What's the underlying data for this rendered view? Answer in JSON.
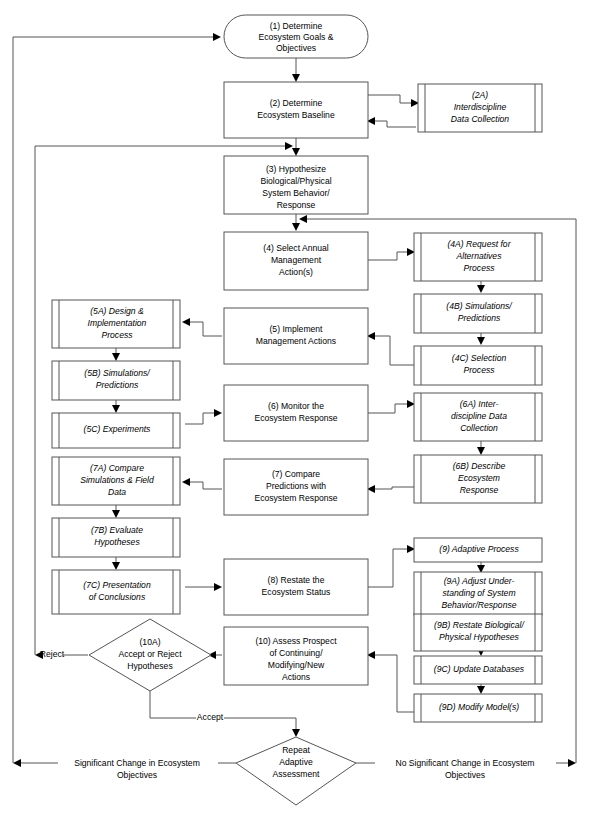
{
  "diagram": {
    "colors": {
      "background": "#ffffff",
      "stroke": "#555555",
      "arrow": "#000000",
      "text": "#000000"
    },
    "nodes": [
      {
        "id": "n1",
        "shape": "terminator",
        "italic": false,
        "lines": [
          "(1) Determine",
          "Ecosystem Goals &",
          "Objectives"
        ]
      },
      {
        "id": "n2",
        "shape": "process",
        "italic": false,
        "lines": [
          "(2) Determine",
          "Ecosystem Baseline"
        ]
      },
      {
        "id": "n2a",
        "shape": "predefined-process",
        "italic": true,
        "lines": [
          "(2A)",
          "Interdiscipline",
          "Data Collection"
        ]
      },
      {
        "id": "n3",
        "shape": "process",
        "italic": false,
        "lines": [
          "(3) Hypothesize",
          "Biological/Physical",
          "System Behavior/",
          "Response"
        ]
      },
      {
        "id": "n4",
        "shape": "process",
        "italic": false,
        "lines": [
          "(4) Select Annual",
          "Management",
          "Action(s)"
        ]
      },
      {
        "id": "n4a",
        "shape": "predefined-process",
        "italic": true,
        "lines": [
          "(4A) Request for",
          "Alternatives",
          "Process"
        ]
      },
      {
        "id": "n4b",
        "shape": "predefined-process",
        "italic": true,
        "lines": [
          "(4B) Simulations/",
          "Predictions"
        ]
      },
      {
        "id": "n4c",
        "shape": "predefined-process",
        "italic": true,
        "lines": [
          "(4C) Selection",
          "Process"
        ]
      },
      {
        "id": "n5",
        "shape": "process",
        "italic": false,
        "lines": [
          "(5) Implement",
          "Management Actions"
        ]
      },
      {
        "id": "n5a",
        "shape": "predefined-process",
        "italic": true,
        "lines": [
          "(5A) Design &",
          "Implementation",
          "Process"
        ]
      },
      {
        "id": "n5b",
        "shape": "predefined-process",
        "italic": true,
        "lines": [
          "(5B) Simulations/",
          "Predictions"
        ]
      },
      {
        "id": "n5c",
        "shape": "predefined-process",
        "italic": true,
        "lines": [
          "(5C) Experiments"
        ]
      },
      {
        "id": "n6",
        "shape": "process",
        "italic": false,
        "lines": [
          "(6) Monitor the",
          "Ecosystem Response"
        ]
      },
      {
        "id": "n6a",
        "shape": "predefined-process",
        "italic": true,
        "lines": [
          "(6A) Inter-",
          "discipline Data",
          "Collection"
        ]
      },
      {
        "id": "n6b",
        "shape": "predefined-process",
        "italic": true,
        "lines": [
          "(6B) Describe",
          "Ecosystem",
          "Response"
        ]
      },
      {
        "id": "n7",
        "shape": "process",
        "italic": false,
        "lines": [
          "(7) Compare",
          "Predictions with",
          "Ecosystem Response"
        ]
      },
      {
        "id": "n7a",
        "shape": "predefined-process",
        "italic": true,
        "lines": [
          "(7A) Compare",
          "Simulations & Field",
          "Data"
        ]
      },
      {
        "id": "n7b",
        "shape": "predefined-process",
        "italic": true,
        "lines": [
          "(7B) Evaluate",
          "Hypotheses"
        ]
      },
      {
        "id": "n7c",
        "shape": "predefined-process",
        "italic": true,
        "lines": [
          "(7C) Presentation",
          "of Conclusions"
        ]
      },
      {
        "id": "n8",
        "shape": "process",
        "italic": false,
        "lines": [
          "(8) Restate the",
          "Ecosystem Status"
        ]
      },
      {
        "id": "n9",
        "shape": "process",
        "italic": true,
        "lines": [
          "(9) Adaptive Process"
        ]
      },
      {
        "id": "n9a",
        "shape": "predefined-process",
        "italic": true,
        "lines": [
          "(9A) Adjust Under-",
          "standing of System",
          "Behavior/Response"
        ]
      },
      {
        "id": "n9b",
        "shape": "predefined-process",
        "italic": true,
        "lines": [
          "(9B) Restate Biological/",
          "Physical Hypotheses"
        ]
      },
      {
        "id": "n9c",
        "shape": "predefined-process",
        "italic": true,
        "lines": [
          "(9C) Update Databases"
        ]
      },
      {
        "id": "n9d",
        "shape": "predefined-process",
        "italic": true,
        "lines": [
          "(9D) Modify Model(s)"
        ]
      },
      {
        "id": "n10",
        "shape": "process",
        "italic": false,
        "lines": [
          "(10) Assess Prospect",
          "of Continuing/",
          "Modifying/New",
          "Actions"
        ]
      },
      {
        "id": "n10a",
        "shape": "decision",
        "italic": false,
        "lines": [
          "(10A)",
          "Accept or Reject",
          "Hypotheses"
        ]
      },
      {
        "id": "nrep",
        "shape": "decision",
        "italic": false,
        "lines": [
          "Repeat",
          "Adaptive",
          "Assessment"
        ]
      }
    ],
    "edge_labels": [
      {
        "id": "lbl_reject",
        "text": "Reject"
      },
      {
        "id": "lbl_accept",
        "text": "Accept"
      },
      {
        "id": "lbl_sig_1",
        "text": "Significant Change in Ecosystem"
      },
      {
        "id": "lbl_sig_2",
        "text": "Objectives"
      },
      {
        "id": "lbl_nosig_1",
        "text": "No Significant Change in Ecosystem"
      },
      {
        "id": "lbl_nosig_2",
        "text": "Objectives"
      }
    ]
  }
}
